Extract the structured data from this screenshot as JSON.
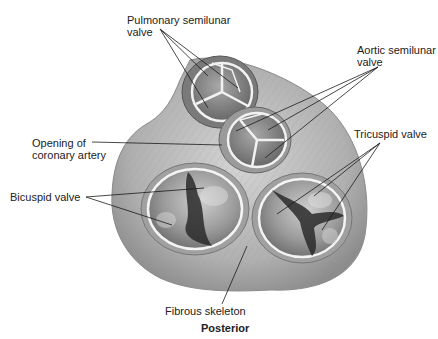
{
  "figure": {
    "orientation_label": "Posterior",
    "colors": {
      "background": "#ffffff",
      "tissue": "#b8b8b8",
      "tissue_dark": "#6e6e6e",
      "valve_rim": "#f2f2f2",
      "valve_interior": "#8a8a8a",
      "chordae_dark": "#2a2a2a",
      "leader_line": "#1a1a1a",
      "label_text": "#222222"
    }
  },
  "labels": [
    {
      "id": "pulmonary",
      "lines": [
        "Pulmonary semilunar",
        "valve"
      ]
    },
    {
      "id": "aortic",
      "lines": [
        "Aortic semilunar",
        "valve"
      ]
    },
    {
      "id": "coronary",
      "lines": [
        "Opening of",
        "coronary artery"
      ]
    },
    {
      "id": "tricuspid",
      "lines": [
        "Tricuspid valve"
      ]
    },
    {
      "id": "bicuspid",
      "lines": [
        "Bicuspid valve"
      ]
    },
    {
      "id": "fibrous",
      "lines": [
        "Fibrous skeleton"
      ]
    }
  ],
  "structures": [
    {
      "name": "Pulmonary semilunar valve",
      "cusps": 3
    },
    {
      "name": "Aortic semilunar valve",
      "cusps": 3
    },
    {
      "name": "Bicuspid valve",
      "cusps": 2
    },
    {
      "name": "Tricuspid valve",
      "cusps": 3
    }
  ]
}
